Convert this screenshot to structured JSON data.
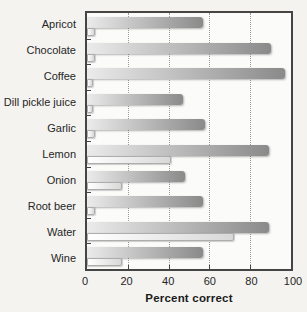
{
  "chart_data": {
    "type": "bar",
    "orientation": "horizontal",
    "title": "",
    "xlabel": "Percent correct",
    "ylabel": "",
    "xlim": [
      0,
      100
    ],
    "xticks": [
      0,
      20,
      40,
      60,
      80,
      100
    ],
    "grid": "vertical-dotted",
    "legend_position": "none",
    "categories": [
      "Apricot",
      "Chocolate",
      "Coffee",
      "Dill pickle juice",
      "Garlic",
      "Lemon",
      "Onion",
      "Root beer",
      "Water",
      "Wine"
    ],
    "series": [
      {
        "name": "dark-gradient-bar",
        "values": [
          57,
          90,
          97,
          47,
          58,
          89,
          48,
          57,
          89,
          57
        ]
      },
      {
        "name": "light-gradient-bar",
        "values": [
          4,
          4,
          3,
          3,
          4,
          41,
          17,
          4,
          72,
          17
        ]
      }
    ]
  },
  "colors": {
    "paper_background": "#f4f3f0",
    "plot_background": "#fbfbfa",
    "frame": "#454545",
    "gridline": "#9a9a9a",
    "bar_dark_gradient_start": "#ebebeb",
    "bar_dark_gradient_end": "#8a8a8a",
    "bar_light_gradient_start": "#ffffff",
    "bar_light_gradient_end": "#d8d8d8"
  }
}
